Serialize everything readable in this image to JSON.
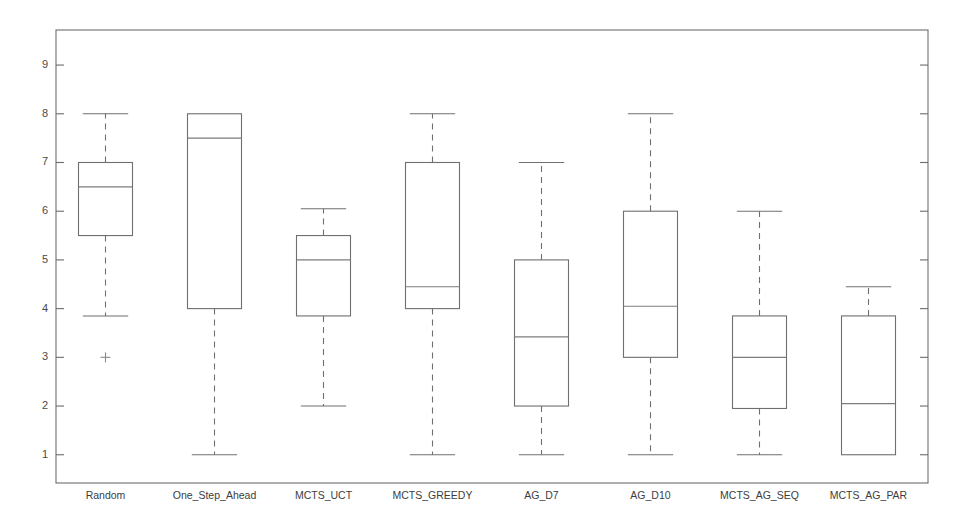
{
  "chart_data": {
    "type": "box",
    "title": "",
    "subtitle": "",
    "xlabel": "",
    "ylabel": "",
    "ylim": [
      0.42,
      9.72
    ],
    "yticks": [
      1,
      2,
      3,
      4,
      5,
      6,
      7,
      8,
      9
    ],
    "ytick_labels": [
      "1",
      "2",
      "3",
      "4",
      "5",
      "6",
      "7",
      "8",
      "9"
    ],
    "grid": false,
    "legend": null,
    "categories": [
      "Random",
      "One_Step_Ahead",
      "MCTS_UCT",
      "MCTS_GREEDY",
      "AG_D7",
      "AG_D10",
      "MCTS_AG_SEQ",
      "MCTS_AG_PAR"
    ],
    "boxes": [
      {
        "name": "Random",
        "whisker_low": 3.85,
        "q1": 5.5,
        "median": 6.5,
        "q3": 7.0,
        "whisker_high": 8.0,
        "outliers": [
          3.0
        ]
      },
      {
        "name": "One_Step_Ahead",
        "whisker_low": 1.0,
        "q1": 4.0,
        "median": 7.5,
        "q3": 8.0,
        "whisker_high": 8.0,
        "outliers": []
      },
      {
        "name": "MCTS_UCT",
        "whisker_low": 2.0,
        "q1": 3.85,
        "median": 5.0,
        "q3": 5.5,
        "whisker_high": 6.05,
        "outliers": []
      },
      {
        "name": "MCTS_GREEDY",
        "whisker_low": 1.0,
        "q1": 4.0,
        "median": 4.45,
        "q3": 7.0,
        "whisker_high": 8.0,
        "outliers": []
      },
      {
        "name": "AG_D7",
        "whisker_low": 1.0,
        "q1": 2.0,
        "median": 3.42,
        "q3": 5.0,
        "whisker_high": 7.0,
        "outliers": []
      },
      {
        "name": "AG_D10",
        "whisker_low": 1.0,
        "q1": 3.0,
        "median": 4.05,
        "q3": 6.0,
        "whisker_high": 8.0,
        "outliers": []
      },
      {
        "name": "MCTS_AG_SEQ",
        "whisker_low": 1.0,
        "q1": 1.95,
        "median": 3.0,
        "q3": 3.85,
        "whisker_high": 6.0,
        "outliers": []
      },
      {
        "name": "MCTS_AG_PAR",
        "whisker_low": 1.0,
        "q1": 1.0,
        "median": 2.05,
        "q3": 3.85,
        "whisker_high": 4.45,
        "outliers": []
      }
    ],
    "colors": {
      "background": "#ffffff",
      "axis": "#6d6d6d",
      "box_outline": "#6f6f6f",
      "median": "#7d7d7d",
      "whisker": "#6f6f6f",
      "outlier": "#8a8a8a",
      "tick_label": "#4a4a4a",
      "category_label": "#3d3d3d"
    },
    "geometry": {
      "plot_left": 56,
      "plot_right": 928,
      "plot_top": 30,
      "plot_bottom": 483,
      "box_width": 54,
      "slot_width": 109,
      "first_center": 105.5
    }
  }
}
